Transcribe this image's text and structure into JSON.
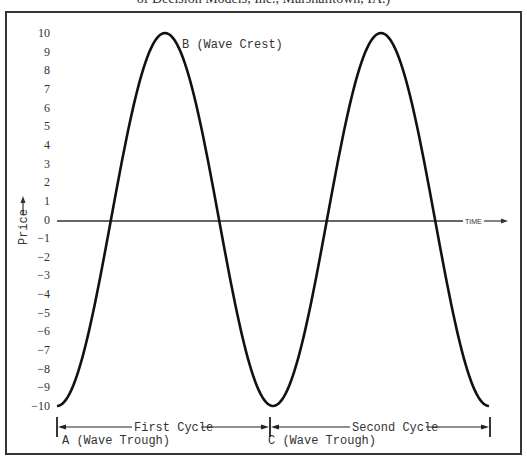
{
  "caption": "of Decision Models, Inc., Marshalltown, IA.)",
  "chart_data": {
    "type": "line",
    "title": "",
    "xlabel": "TIME",
    "ylabel": "Price",
    "ylim": [
      -10,
      10
    ],
    "yticks": [
      "10",
      "9",
      "8",
      "7",
      "6",
      "5",
      "4",
      "3",
      "2",
      "1",
      "0",
      "-1",
      "-2",
      "-3",
      "-4",
      "-5",
      "-6",
      "-7",
      "-8",
      "-9",
      "-10"
    ],
    "grid": false,
    "series": [
      {
        "name": "Price wave (sine)",
        "description": "Two full cycles of a sine wave, amplitude 10, starting at a trough",
        "x": [
          0,
          0.25,
          0.5,
          0.75,
          1.0,
          1.25,
          1.5,
          1.75,
          2.0
        ],
        "values": [
          -10,
          0,
          10,
          0,
          -10,
          0,
          10,
          0,
          -10
        ]
      }
    ],
    "annotations": [
      {
        "label": "A (Wave Trough)",
        "x": 0,
        "y": -10
      },
      {
        "label": "B (Wave Crest)",
        "x": 0.5,
        "y": 10
      },
      {
        "label": "C (Wave Trough)",
        "x": 1.0,
        "y": -10
      },
      {
        "label": "First Cycle",
        "span": [
          0,
          1.0
        ]
      },
      {
        "label": "Second Cycle",
        "span": [
          1.0,
          2.0
        ]
      }
    ]
  },
  "labels": {
    "price_axis": "Price",
    "time_axis": "TIME",
    "point_a": "A (Wave Trough)",
    "point_b": "B (Wave Crest)",
    "point_c": "C (Wave Trough)",
    "first_cycle": "First Cycle",
    "second_cycle": "Second Cycle"
  }
}
